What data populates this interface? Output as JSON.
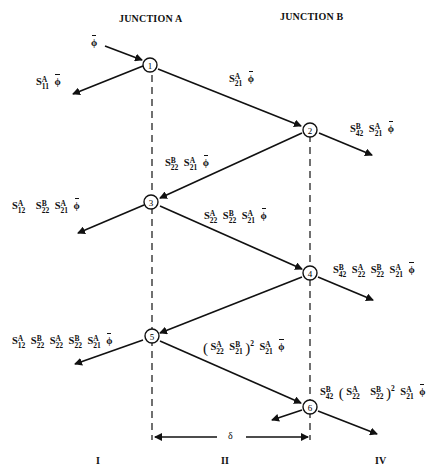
{
  "headers": {
    "junction_a": "JUNCTION A",
    "junction_b": "JUNCTION B"
  },
  "nodes": [
    "1",
    "2",
    "3",
    "4",
    "5",
    "6"
  ],
  "incident": {
    "phi": "ϕ"
  },
  "labels": {
    "refl_1": "S11A ϕ̄",
    "trans_1_2": "S21A ϕ̄",
    "out_2": "S42B S21A ϕ̄",
    "refl_2_3": "S22B S21A ϕ̄",
    "out_3": "S12A S22B S21A ϕ̄",
    "trans_3_4": "S22A S22B S21A ϕ̄",
    "out_4": "S42B S22A S22B S21A ϕ̄",
    "out_5": "S12A S22B S22A S22B S21A ϕ̄",
    "trans_5_6": "(S22A S21B)^2 S21A ϕ̄",
    "out_6": "S42B (S22A S22B)^2 S21A ϕ̄"
  },
  "dimension": {
    "delta": "δ"
  },
  "regions": {
    "r1": "I",
    "r2": "II",
    "r4": "IV"
  },
  "sym": {
    "S": "S",
    "A": "A",
    "B": "B",
    "phi": "ϕ",
    "sq": "2",
    "lp": "(",
    "rp": ")",
    "i11": "11",
    "i21": "21",
    "i42": "42",
    "i22": "22",
    "i12": "12"
  }
}
